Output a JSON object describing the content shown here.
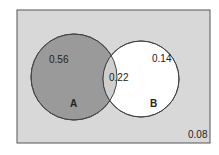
{
  "diagram": {
    "type": "venn",
    "sets": [
      {
        "name": "A",
        "only_value": "0.56"
      },
      {
        "name": "B",
        "only_value": "0.14"
      }
    ],
    "intersection_value": "0.22",
    "outside_value": "0.08",
    "colors": {
      "background": "#d8d8d8",
      "set_a_fill": "#9a9a9a",
      "set_b_fill": "#ffffff",
      "intersection_fill": "#cfcfcf",
      "stroke": "#444444"
    }
  }
}
